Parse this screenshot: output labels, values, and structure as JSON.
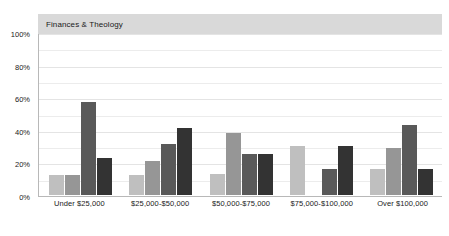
{
  "chart_data": {
    "type": "bar",
    "title": "Finances & Theology",
    "xlabel": "",
    "ylabel": "",
    "ylim": [
      0,
      100
    ],
    "ytick_labels": [
      "100%",
      "80%",
      "60%",
      "40%",
      "20%",
      "0%"
    ],
    "ytick_values": [
      100,
      80,
      60,
      40,
      20,
      0
    ],
    "grid": true,
    "legend": "none",
    "categories": [
      "Under $25,000",
      "$25,000-$50,000",
      "$50,000-$75,000",
      "$75,000-$100,000",
      "Over $100,000"
    ],
    "series": [
      {
        "name": "Series 1",
        "color": "#bfbfbf",
        "values": [
          12,
          12,
          13,
          30,
          16
        ]
      },
      {
        "name": "Series 2",
        "color": "#969696",
        "values": [
          12,
          21,
          38,
          null,
          29
        ]
      },
      {
        "name": "Series 3",
        "color": "#595959",
        "values": [
          57,
          31,
          25,
          16,
          43
        ]
      },
      {
        "name": "Series 4",
        "color": "#333333",
        "values": [
          23,
          41,
          25,
          30,
          16
        ]
      }
    ],
    "group_values": [
      [
        12,
        12,
        57,
        23
      ],
      [
        12,
        21,
        31,
        41
      ],
      [
        13,
        38,
        25,
        25
      ],
      [
        30,
        null,
        16,
        30
      ],
      [
        16,
        29,
        43,
        16
      ]
    ]
  },
  "styling": {
    "title_band_color": "#d9d9d9",
    "gridline_color": "#ececec",
    "axis_color": "#b8b8b8",
    "background": "#ffffff",
    "text_color": "#1a1a1a"
  }
}
